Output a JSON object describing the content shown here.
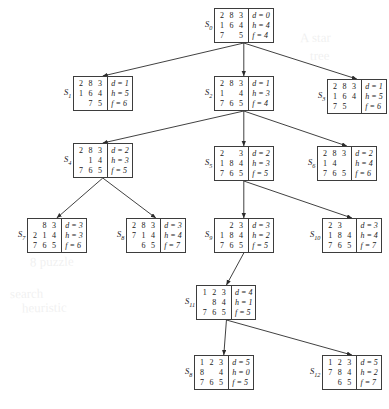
{
  "figure": {
    "kind": "search-tree-diagram"
  },
  "nodes": [
    {
      "id": "S0",
      "label": "S",
      "sub": "0",
      "grid": [
        "2",
        "8",
        "3",
        "1",
        "6",
        "4",
        "7",
        "",
        "5"
      ],
      "d": "d = 0",
      "h": "h = 4",
      "f": "f = 4",
      "x": 205,
      "y": 8
    },
    {
      "id": "S1",
      "label": "S",
      "sub": "1",
      "grid": [
        "2",
        "8",
        "3",
        "1",
        "6",
        "4",
        "",
        "7",
        "5"
      ],
      "d": "d = 1",
      "h": "h = 5",
      "f": "f = 6",
      "x": 64,
      "y": 76
    },
    {
      "id": "S2",
      "label": "S",
      "sub": "2",
      "grid": [
        "2",
        "8",
        "3",
        "1",
        "",
        "4",
        "7",
        "6",
        "5"
      ],
      "d": "d = 1",
      "h": "h = 3",
      "f": "f = 4",
      "x": 205,
      "y": 76
    },
    {
      "id": "S3",
      "label": "S",
      "sub": "3",
      "grid": [
        "2",
        "8",
        "3",
        "1",
        "6",
        "4",
        "7",
        "5",
        ""
      ],
      "d": "d = 1",
      "h": "h = 5",
      "f": "f = 6",
      "x": 318,
      "y": 79
    },
    {
      "id": "S4",
      "label": "S",
      "sub": "4",
      "grid": [
        "2",
        "8",
        "3",
        "",
        "1",
        "4",
        "7",
        "6",
        "5"
      ],
      "d": "d = 2",
      "h": "h = 3",
      "f": "f = 5",
      "x": 64,
      "y": 143
    },
    {
      "id": "S5",
      "label": "S",
      "sub": "5",
      "grid": [
        "2",
        "",
        "3",
        "1",
        "8",
        "4",
        "7",
        "6",
        "5"
      ],
      "d": "d = 2",
      "h": "h = 3",
      "f": "f = 5",
      "x": 205,
      "y": 146
    },
    {
      "id": "S6",
      "label": "S",
      "sub": "6",
      "grid": [
        "2",
        "8",
        "3",
        "1",
        "4",
        "",
        "7",
        "6",
        "5"
      ],
      "d": "d = 2",
      "h": "h = 4",
      "f": "f = 6",
      "x": 308,
      "y": 146
    },
    {
      "id": "S7",
      "label": "S",
      "sub": "7",
      "grid": [
        "",
        "8",
        "3",
        "2",
        "1",
        "4",
        "7",
        "6",
        "5"
      ],
      "d": "d = 3",
      "h": "h = 3",
      "f": "f = 6",
      "x": 18,
      "y": 218
    },
    {
      "id": "S8a",
      "label": "S",
      "sub": "8",
      "grid": [
        "2",
        "8",
        "3",
        "7",
        "1",
        "4",
        "",
        "6",
        "5"
      ],
      "d": "d = 3",
      "h": "h = 4",
      "f": "f = 7",
      "x": 117,
      "y": 218
    },
    {
      "id": "S9",
      "label": "S",
      "sub": "9",
      "grid": [
        "",
        "2",
        "3",
        "1",
        "8",
        "4",
        "7",
        "6",
        "5"
      ],
      "d": "d = 3",
      "h": "h = 2",
      "f": "f = 5",
      "x": 205,
      "y": 218
    },
    {
      "id": "S10",
      "label": "S",
      "sub": "10",
      "grid": [
        "2",
        "3",
        "",
        "1",
        "8",
        "4",
        "7",
        "6",
        "5"
      ],
      "d": "d = 3",
      "h": "h = 4",
      "f": "f = 7",
      "x": 310,
      "y": 218
    },
    {
      "id": "S11",
      "label": "S",
      "sub": "11",
      "grid": [
        "1",
        "2",
        "3",
        "",
        "8",
        "4",
        "7",
        "6",
        "5"
      ],
      "d": "d = 4",
      "h": "h = 1",
      "f": "f = 5",
      "x": 185,
      "y": 285
    },
    {
      "id": "S8b",
      "label": "S",
      "sub": "8",
      "grid": [
        "1",
        "2",
        "3",
        "8",
        "",
        "4",
        "7",
        "6",
        "5"
      ],
      "d": "d = 5",
      "h": "h = 0",
      "f": "f = 5",
      "x": 185,
      "y": 355
    },
    {
      "id": "S12",
      "label": "S",
      "sub": "12",
      "grid": [
        "1",
        "2",
        "3",
        "7",
        "8",
        "4",
        "",
        "6",
        "5"
      ],
      "d": "d = 5",
      "h": "h = 2",
      "f": "f = 7",
      "x": 310,
      "y": 355
    }
  ],
  "edges": [
    {
      "from": "S0",
      "to": "S1"
    },
    {
      "from": "S0",
      "to": "S2"
    },
    {
      "from": "S0",
      "to": "S3"
    },
    {
      "from": "S2",
      "to": "S4"
    },
    {
      "from": "S2",
      "to": "S5"
    },
    {
      "from": "S2",
      "to": "S6"
    },
    {
      "from": "S4",
      "to": "S7"
    },
    {
      "from": "S4",
      "to": "S8a"
    },
    {
      "from": "S5",
      "to": "S9"
    },
    {
      "from": "S5",
      "to": "S10"
    },
    {
      "from": "S9",
      "to": "S11"
    },
    {
      "from": "S11",
      "to": "S8b"
    },
    {
      "from": "S11",
      "to": "S12"
    }
  ],
  "background_text": [
    {
      "text": "8 puzzle",
      "x": 30,
      "y": 254,
      "rotate": -1
    },
    {
      "text": "search",
      "x": 10,
      "y": 286,
      "rotate": -1
    },
    {
      "text": "heuristic",
      "x": 22,
      "y": 300,
      "rotate": -1
    },
    {
      "text": "A star",
      "x": 300,
      "y": 30,
      "rotate": -1
    },
    {
      "text": "tree",
      "x": 310,
      "y": 48,
      "rotate": -1
    }
  ]
}
